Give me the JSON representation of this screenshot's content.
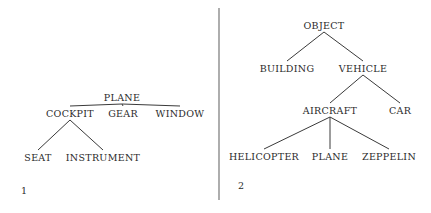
{
  "diagrams": [
    {
      "label": "1",
      "nodes": [
        {
          "id": "plane",
          "text": "PLANE"
        },
        {
          "id": "cockpit",
          "text": "COCKPIT"
        },
        {
          "id": "gear",
          "text": "GEAR"
        },
        {
          "id": "window",
          "text": "WINDOW"
        },
        {
          "id": "seat",
          "text": "SEAT"
        },
        {
          "id": "instrument",
          "text": "INSTRUMENT"
        }
      ],
      "edges": [
        [
          "plane",
          "cockpit"
        ],
        [
          "plane",
          "gear"
        ],
        [
          "plane",
          "window"
        ],
        [
          "cockpit",
          "seat"
        ],
        [
          "cockpit",
          "instrument"
        ]
      ]
    },
    {
      "label": "2",
      "nodes": [
        {
          "id": "object",
          "text": "OBJECT"
        },
        {
          "id": "building",
          "text": "BUILDING"
        },
        {
          "id": "vehicle",
          "text": "VEHICLE"
        },
        {
          "id": "aircraft",
          "text": "AIRCRAFT"
        },
        {
          "id": "car",
          "text": "CAR"
        },
        {
          "id": "helicopter",
          "text": "HELICOPTER"
        },
        {
          "id": "plane2",
          "text": "PLANE"
        },
        {
          "id": "zeppelin",
          "text": "ZEPPELIN"
        }
      ],
      "edges": [
        [
          "object",
          "building"
        ],
        [
          "object",
          "vehicle"
        ],
        [
          "vehicle",
          "aircraft"
        ],
        [
          "vehicle",
          "car"
        ],
        [
          "aircraft",
          "helicopter"
        ],
        [
          "aircraft",
          "plane2"
        ],
        [
          "aircraft",
          "zeppelin"
        ]
      ]
    }
  ]
}
